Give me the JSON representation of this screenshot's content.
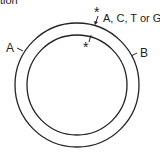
{
  "header_fragment": "tion",
  "diagram": {
    "outer_strand_label": "A",
    "inner_strand_label": "B",
    "mutation_outer_marker": "*",
    "mutation_inner_marker": "*",
    "mutation_base_label": "A, C, T or G"
  },
  "colors": {
    "line": "#222222",
    "background": "#ffffff"
  }
}
